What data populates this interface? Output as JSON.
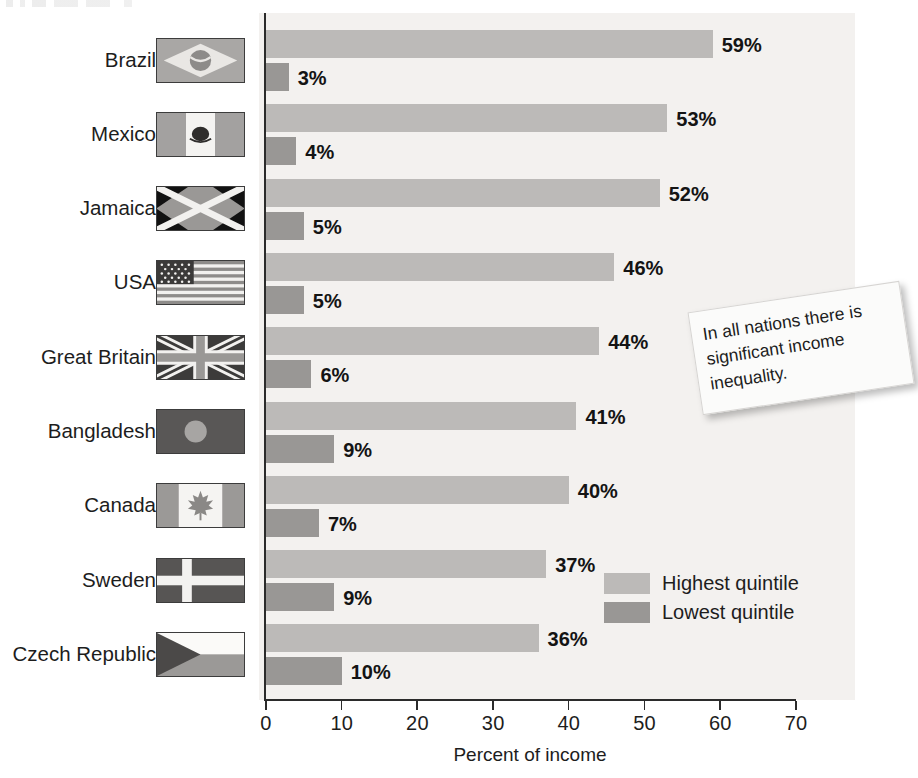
{
  "chart_data": {
    "type": "bar",
    "orientation": "horizontal",
    "title": "",
    "xlabel": "Percent of income",
    "ylabel": "",
    "xlim": [
      0,
      70
    ],
    "xticks": [
      0,
      10,
      20,
      30,
      40,
      50,
      60,
      70
    ],
    "grid": false,
    "legend_position": "inside-right-lower",
    "categories": [
      "Brazil",
      "Mexico",
      "Jamaica",
      "USA",
      "Great Britain",
      "Bangladesh",
      "Canada",
      "Sweden",
      "Czech Republic"
    ],
    "series": [
      {
        "name": "Highest quintile",
        "color": "#bcbab8",
        "values": [
          59,
          53,
          52,
          46,
          44,
          41,
          40,
          37,
          36
        ],
        "labels": [
          "59%",
          "53%",
          "52%",
          "46%",
          "44%",
          "41%",
          "40%",
          "37%",
          "36%"
        ]
      },
      {
        "name": "Lowest quintile",
        "color": "#999795",
        "values": [
          3,
          4,
          5,
          5,
          6,
          9,
          7,
          9,
          10
        ],
        "labels": [
          "3%",
          "4%",
          "5%",
          "5%",
          "6%",
          "9%",
          "7%",
          "9%",
          "10%"
        ]
      }
    ],
    "annotations": [
      {
        "text": "In all nations there is significant income inequality."
      }
    ]
  },
  "axis": {
    "tick_labels": [
      "0",
      "10",
      "20",
      "30",
      "40",
      "50",
      "60",
      "70"
    ],
    "x_title": "Percent of income"
  },
  "legend": {
    "items": [
      {
        "label": "Highest quintile",
        "color": "#bcbab8"
      },
      {
        "label": "Lowest quintile",
        "color": "#999795"
      }
    ]
  },
  "rows": [
    {
      "country": "Brazil",
      "flag": "flag-brazil",
      "high": "59%",
      "low": "3%"
    },
    {
      "country": "Mexico",
      "flag": "flag-mexico",
      "high": "53%",
      "low": "4%"
    },
    {
      "country": "Jamaica",
      "flag": "flag-jamaica",
      "high": "52%",
      "low": "5%"
    },
    {
      "country": "USA",
      "flag": "flag-usa",
      "high": "46%",
      "low": "5%"
    },
    {
      "country": "Great Britain",
      "flag": "flag-great-britain",
      "high": "44%",
      "low": "6%"
    },
    {
      "country": "Bangladesh",
      "flag": "flag-bangladesh",
      "high": "41%",
      "low": "9%"
    },
    {
      "country": "Canada",
      "flag": "flag-canada",
      "high": "40%",
      "low": "7%"
    },
    {
      "country": "Sweden",
      "flag": "flag-sweden",
      "high": "37%",
      "low": "9%"
    },
    {
      "country": "Czech Republic",
      "flag": "flag-czech-republic",
      "high": "36%",
      "low": "10%"
    }
  ],
  "callout": {
    "text": "In all nations there is significant income inequality."
  },
  "colors": {
    "highest_quintile": "#bcbab8",
    "lowest_quintile": "#999795",
    "plot_background": "#f3f1ef",
    "axis": "#2b2b2b",
    "text": "#1d1d1d"
  }
}
